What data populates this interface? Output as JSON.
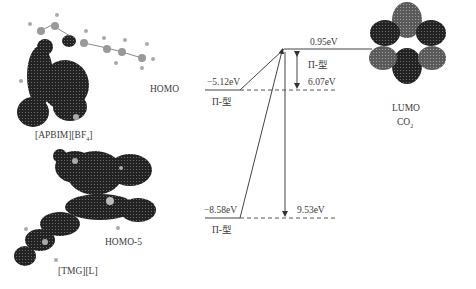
{
  "diagram": {
    "molecules": {
      "apbim": {
        "name": "[APBIM][BF4]",
        "name_main": "[APBIM][BF",
        "name_sub": "4",
        "name_end": "]",
        "orbital": "HOMO"
      },
      "tmg": {
        "name": "[TMG][L]",
        "orbital": "HOMO-5"
      },
      "co2": {
        "orbital": "LUMO",
        "name_main": "CO",
        "name_sub": "2"
      }
    },
    "levels": {
      "homo": {
        "energy": "−5.12eV",
        "type": "Π-型"
      },
      "homo5": {
        "energy": "−8.58eV",
        "type": "Π-型"
      },
      "lumo": {
        "energy": "0.95eV"
      }
    },
    "gaps": {
      "homo_lumo": {
        "value": "6.07eV",
        "type": "Π-型"
      },
      "homo5_lumo": {
        "value": "9.53eV"
      }
    },
    "colors": {
      "line": "#444444",
      "orbital_dark": "#1e1e1e",
      "orbital_light": "#6e6e6e",
      "atom": "#9a9a9a"
    }
  }
}
